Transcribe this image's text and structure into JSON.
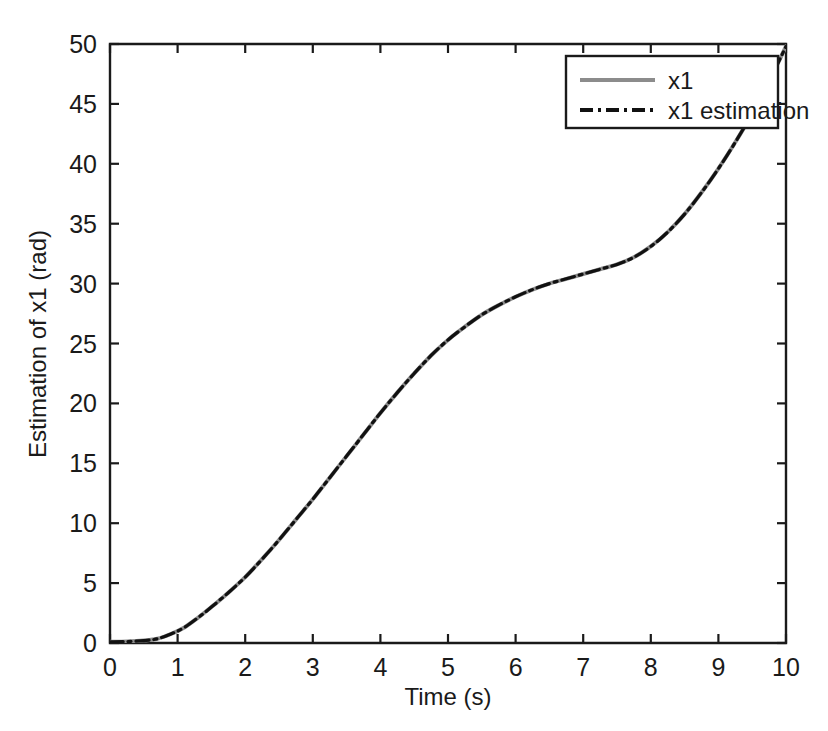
{
  "figure": {
    "background_color": "#ffffff",
    "axes_color": "#1a1a1a"
  },
  "axis": {
    "x_title": "Time (s)",
    "y_title": "Estimation of x1 (rad)",
    "x_ticks": [
      "0",
      "1",
      "2",
      "3",
      "4",
      "5",
      "6",
      "7",
      "8",
      "9",
      "10"
    ],
    "y_ticks": [
      "0",
      "5",
      "10",
      "15",
      "20",
      "25",
      "30",
      "35",
      "40",
      "45",
      "50"
    ]
  },
  "legend": {
    "entries": [
      {
        "label": "x1",
        "style": "solid",
        "color": "#8c8c8c"
      },
      {
        "label": "x1 estimation",
        "style": "dashdot",
        "color": "#111111"
      }
    ]
  },
  "chart_data": {
    "type": "line",
    "title": "",
    "xlabel": "Time (s)",
    "ylabel": "Estimation of x1 (rad)",
    "xlim": [
      0,
      10
    ],
    "ylim": [
      0,
      50
    ],
    "xticks": [
      0,
      1,
      2,
      3,
      4,
      5,
      6,
      7,
      8,
      9,
      10
    ],
    "yticks": [
      0,
      5,
      10,
      15,
      20,
      25,
      30,
      35,
      40,
      45,
      50
    ],
    "grid": false,
    "legend_position": "top-right-inside",
    "x": [
      0,
      0.25,
      0.5,
      0.7,
      0.9,
      1.1,
      1.3,
      1.5,
      1.75,
      2.0,
      2.25,
      2.5,
      2.75,
      3.0,
      3.25,
      3.5,
      3.75,
      4.0,
      4.25,
      4.5,
      4.75,
      5.0,
      5.25,
      5.5,
      5.75,
      6.0,
      6.25,
      6.5,
      6.75,
      7.0,
      7.25,
      7.5,
      7.75,
      8.0,
      8.25,
      8.5,
      8.75,
      9.0,
      9.25,
      9.5,
      9.75,
      10.0
    ],
    "series": [
      {
        "name": "x1",
        "style": "solid",
        "color": "#8c8c8c",
        "values": [
          0.1,
          0.12,
          0.2,
          0.35,
          0.75,
          1.3,
          2.1,
          3.0,
          4.2,
          5.5,
          7.0,
          8.6,
          10.3,
          12.0,
          13.8,
          15.6,
          17.4,
          19.2,
          20.9,
          22.5,
          24.0,
          25.3,
          26.4,
          27.4,
          28.2,
          28.9,
          29.5,
          30.0,
          30.4,
          30.8,
          31.2,
          31.6,
          32.2,
          33.1,
          34.3,
          35.8,
          37.6,
          39.6,
          41.8,
          44.2,
          46.9,
          49.8
        ]
      },
      {
        "name": "x1 estimation",
        "style": "dashdot",
        "color": "#111111",
        "values": [
          0.1,
          0.12,
          0.2,
          0.35,
          0.75,
          1.3,
          2.1,
          3.0,
          4.2,
          5.5,
          7.0,
          8.6,
          10.3,
          12.0,
          13.8,
          15.6,
          17.4,
          19.2,
          20.9,
          22.5,
          24.0,
          25.3,
          26.4,
          27.4,
          28.2,
          28.9,
          29.5,
          30.0,
          30.4,
          30.8,
          31.2,
          31.6,
          32.2,
          33.1,
          34.3,
          35.8,
          37.6,
          39.6,
          41.8,
          44.2,
          46.9,
          49.8
        ]
      }
    ]
  }
}
